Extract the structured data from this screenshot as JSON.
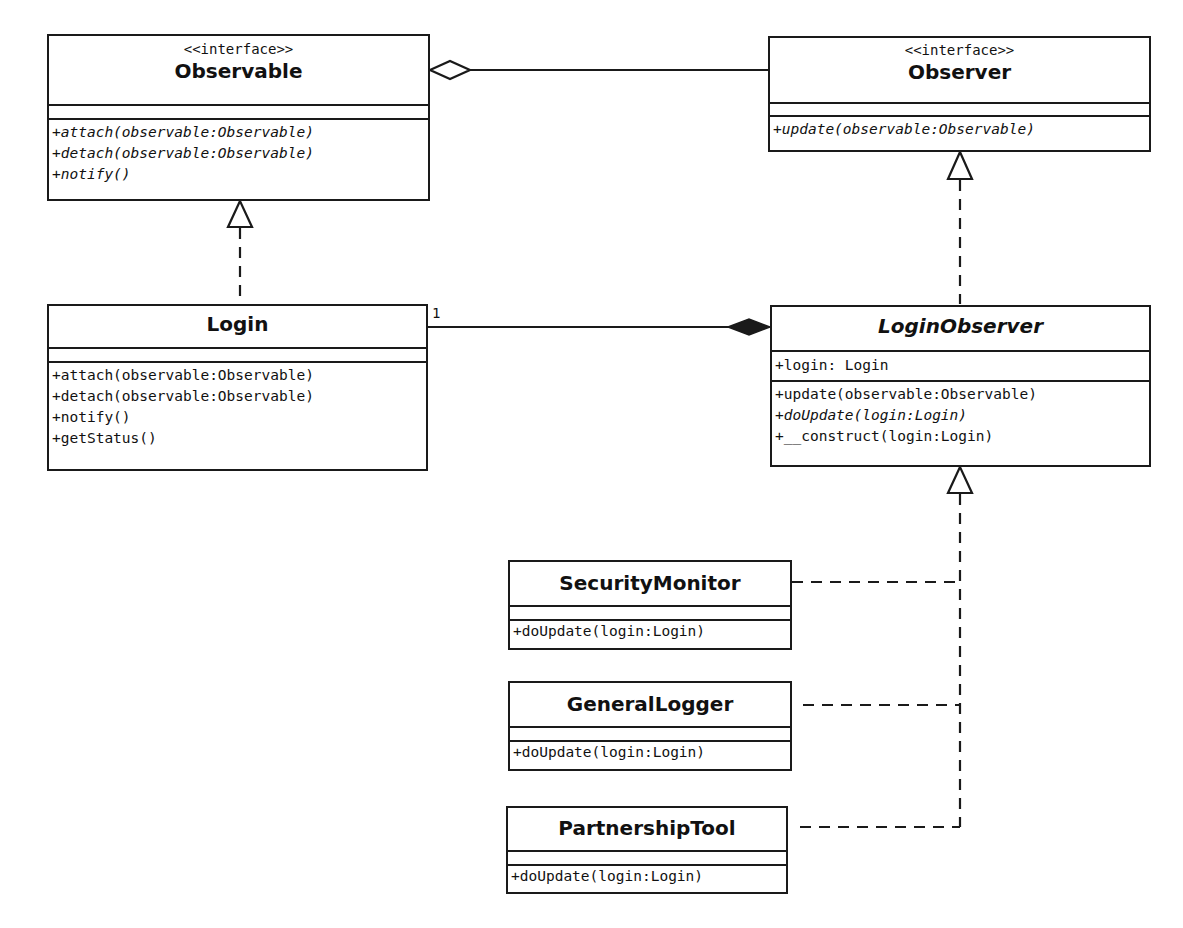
{
  "diagram": {
    "type": "UML class diagram",
    "pattern": "Observer",
    "classes": {
      "observable": {
        "stereotype": "<<interface>>",
        "name": "Observable",
        "attributes": [],
        "operations": [
          {
            "text": "+attach(observable:Observable)",
            "italic": true
          },
          {
            "text": "+detach(observable:Observable)",
            "italic": true
          },
          {
            "text": "+notify()",
            "italic": true
          }
        ]
      },
      "observer": {
        "stereotype": "<<interface>>",
        "name": "Observer",
        "attributes": [],
        "operations": [
          {
            "text": "+update(observable:Observable)",
            "italic": true
          }
        ]
      },
      "login": {
        "name": "Login",
        "attributes": [],
        "operations": [
          {
            "text": "+attach(observable:Observable)",
            "italic": false
          },
          {
            "text": "+detach(observable:Observable)",
            "italic": false
          },
          {
            "text": "+notify()",
            "italic": false
          },
          {
            "text": "+getStatus()",
            "italic": false
          }
        ]
      },
      "login_observer": {
        "name": "LoginObserver",
        "abstract": true,
        "attributes": [
          {
            "text": "+login: Login"
          }
        ],
        "operations": [
          {
            "text": "+update(observable:Observable)",
            "italic": false
          },
          {
            "text": "+doUpdate(login:Login)",
            "italic": true
          },
          {
            "text": "+__construct(login:Login)",
            "italic": false
          }
        ]
      },
      "security_monitor": {
        "name": "SecurityMonitor",
        "attributes": [],
        "operations": [
          {
            "text": "+doUpdate(login:Login)",
            "italic": false
          }
        ]
      },
      "general_logger": {
        "name": "GeneralLogger",
        "attributes": [],
        "operations": [
          {
            "text": "+doUpdate(login:Login)",
            "italic": false
          }
        ]
      },
      "partnership_tool": {
        "name": "PartnershipTool",
        "attributes": [],
        "operations": [
          {
            "text": "+doUpdate(login:Login)",
            "italic": false
          }
        ]
      }
    },
    "relationships": [
      {
        "type": "aggregation",
        "from": "Observer",
        "to": "Observable",
        "diamond_at": "Observable"
      },
      {
        "type": "realization",
        "from": "Login",
        "to": "Observable"
      },
      {
        "type": "realization",
        "from": "LoginObserver",
        "to": "Observer"
      },
      {
        "type": "composition",
        "from": "Login",
        "to": "LoginObserver",
        "diamond_at": "LoginObserver",
        "multiplicity_at_login": "1"
      },
      {
        "type": "realization",
        "from": "SecurityMonitor",
        "to": "LoginObserver"
      },
      {
        "type": "realization",
        "from": "GeneralLogger",
        "to": "LoginObserver"
      },
      {
        "type": "realization",
        "from": "PartnershipTool",
        "to": "LoginObserver"
      }
    ],
    "colors": {
      "line": "#1a1a1a",
      "background": "#ffffff"
    }
  }
}
